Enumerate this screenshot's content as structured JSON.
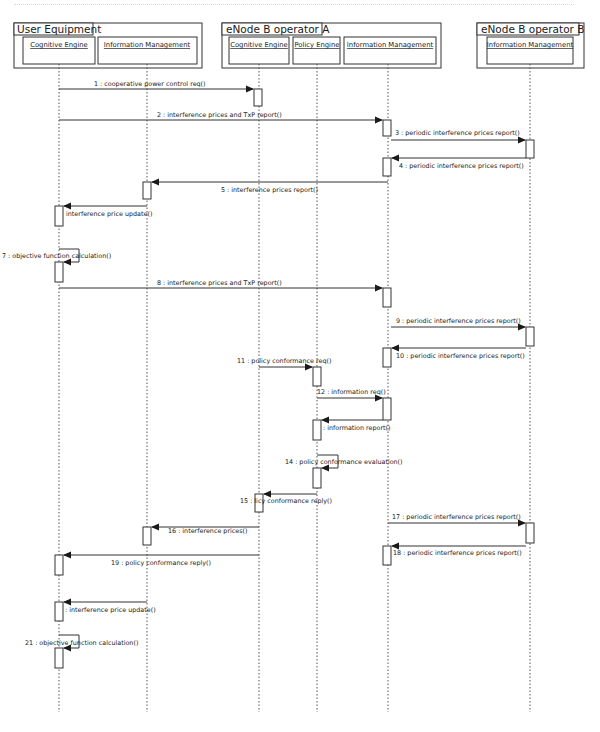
{
  "diagram": {
    "type": "uml-sequence-diagram",
    "groups": [
      {
        "id": "ue",
        "title": "User Equipment"
      },
      {
        "id": "enb_a",
        "title": "eNode B operator A"
      },
      {
        "id": "enb_b",
        "title": "eNode B operator B"
      }
    ],
    "participants": [
      {
        "id": "ue_ce",
        "group": "ue",
        "name": "Cognitive Engine"
      },
      {
        "id": "ue_im",
        "group": "ue",
        "name": "Information Management"
      },
      {
        "id": "a_ce",
        "group": "enb_a",
        "name": "Cognitive Engine"
      },
      {
        "id": "a_pe",
        "group": "enb_a",
        "name": "Policy Engine"
      },
      {
        "id": "a_im",
        "group": "enb_a",
        "name": "Information Management"
      },
      {
        "id": "b_im",
        "group": "enb_b",
        "name": "Information Management"
      }
    ],
    "messages": [
      {
        "n": 1,
        "from": "ue_ce",
        "to": "a_ce",
        "label": "1 : cooperative power control req()"
      },
      {
        "n": 2,
        "from": "ue_ce",
        "to": "a_im",
        "label": "2 : interference prices and TxP report()"
      },
      {
        "n": 3,
        "from": "a_im",
        "to": "b_im",
        "label": "3 : periodic interference prices report()"
      },
      {
        "n": 4,
        "from": "b_im",
        "to": "a_im",
        "label": "4 : periodic interference prices report()"
      },
      {
        "n": 5,
        "from": "a_im",
        "to": "ue_im",
        "label": "5 : interference prices report()"
      },
      {
        "n": 6,
        "from": "ue_im",
        "to": "ue_ce",
        "label": "interference price update()"
      },
      {
        "n": 7,
        "from": "ue_ce",
        "to": "ue_ce",
        "label": "7 : objective function calculation()"
      },
      {
        "n": 8,
        "from": "ue_ce",
        "to": "a_im",
        "label": "8 : interference prices and TxP report()"
      },
      {
        "n": 9,
        "from": "a_im",
        "to": "b_im",
        "label": "9 : periodic interference prices report()"
      },
      {
        "n": 10,
        "from": "b_im",
        "to": "a_im",
        "label": "10 : periodic interference prices report()"
      },
      {
        "n": 11,
        "from": "a_ce",
        "to": "a_pe",
        "label": "11 : policy conformance req()"
      },
      {
        "n": 12,
        "from": "a_pe",
        "to": "a_im",
        "label": "12 : information req()"
      },
      {
        "n": 13,
        "from": "a_im",
        "to": "a_pe",
        "label": ": information report()"
      },
      {
        "n": 14,
        "from": "a_pe",
        "to": "a_pe",
        "label": "14 : policy conformance evaluation()"
      },
      {
        "n": 15,
        "from": "a_pe",
        "to": "a_ce",
        "label": "15 :  licy conformance reply()"
      },
      {
        "n": 16,
        "from": "a_ce",
        "to": "ue_im",
        "label": "16 : interference prices()"
      },
      {
        "n": 17,
        "from": "a_im",
        "to": "b_im",
        "label": "17 : periodic interference prices report()"
      },
      {
        "n": 18,
        "from": "b_im",
        "to": "a_im",
        "label": "18 : periodic interference prices report()"
      },
      {
        "n": 19,
        "from": "a_ce",
        "to": "ue_ce",
        "label": "19 : policy conformance reply()"
      },
      {
        "n": 20,
        "from": "ue_im",
        "to": "ue_ce",
        "label": ": interference price update()"
      },
      {
        "n": 21,
        "from": "ue_ce",
        "to": "ue_ce",
        "label": "21 : objective function calculation()"
      }
    ],
    "colors": {
      "line": "#333333",
      "box_fill": "#ffffff",
      "lifeline": "#555555"
    }
  }
}
